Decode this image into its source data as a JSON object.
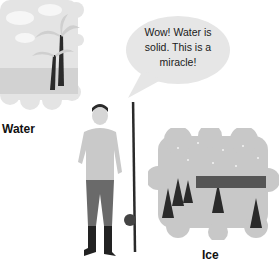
{
  "speech_bubble": {
    "text_lines": [
      "Wow! Water is",
      "solid. This is a",
      "miracle!"
    ]
  },
  "labels": {
    "water": "Water",
    "ice": "Ice"
  },
  "colors": {
    "cloud": "#e4e4e4",
    "sea": "#cfcfcf",
    "ice_cloud": "#c8c8c8",
    "bubble": "#e6e6e6",
    "dark": "#2a2a2a"
  }
}
